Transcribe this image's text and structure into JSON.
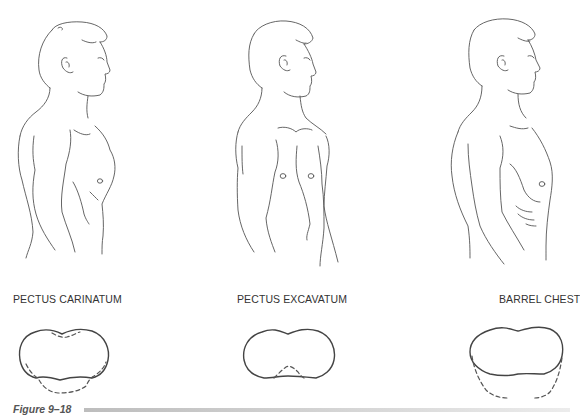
{
  "figures": [
    {
      "id": "pectus-carinatum",
      "label": "PECTUS CARINATUM"
    },
    {
      "id": "pectus-excavatum",
      "label": "PECTUS EXCAVATUM"
    },
    {
      "id": "barrel-chest",
      "label": "BARREL CHEST"
    }
  ],
  "caption": "Figure 9–18",
  "colors": {
    "line": "#555555",
    "caption_bar": "#c8c8c8"
  }
}
